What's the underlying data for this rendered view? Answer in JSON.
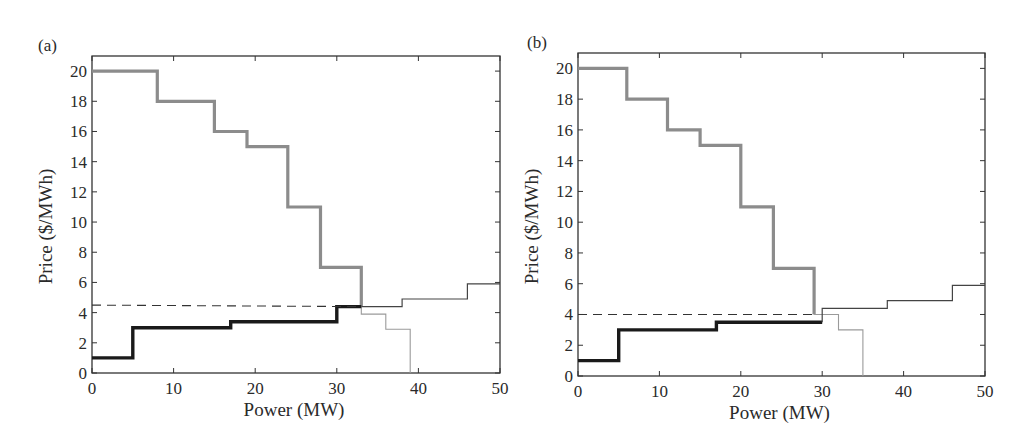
{
  "chart_data": [
    {
      "type": "line",
      "panel_label": "(a)",
      "xlabel": "Power (MW)",
      "ylabel": "Price ($/MWh)",
      "xlim": [
        0,
        50
      ],
      "ylim": [
        0,
        21
      ],
      "xticks": [
        0,
        10,
        20,
        30,
        40,
        50
      ],
      "yticks": [
        0,
        2,
        4,
        6,
        8,
        10,
        12,
        14,
        16,
        18,
        20
      ],
      "grid": false,
      "series": [
        {
          "name": "demand-bid-accepted",
          "style": "thick-gray",
          "color": "#8c8c8c",
          "step_points": [
            [
              0,
              20
            ],
            [
              8,
              20
            ],
            [
              8,
              18
            ],
            [
              15,
              18
            ],
            [
              15,
              16
            ],
            [
              19,
              16
            ],
            [
              19,
              15
            ],
            [
              24,
              15
            ],
            [
              24,
              11
            ],
            [
              28,
              11
            ],
            [
              28,
              7
            ],
            [
              33,
              7
            ],
            [
              33,
              4.4
            ]
          ]
        },
        {
          "name": "demand-bid-rejected",
          "style": "thin-gray",
          "color": "#9a9a9a",
          "step_points": [
            [
              33,
              4.4
            ],
            [
              33,
              3.9
            ],
            [
              36,
              3.9
            ],
            [
              36,
              2.9
            ],
            [
              39,
              2.9
            ],
            [
              39,
              0
            ]
          ]
        },
        {
          "name": "supply-offer-accepted",
          "style": "thick-black",
          "color": "#1a1a1a",
          "step_points": [
            [
              0,
              1
            ],
            [
              5,
              1
            ],
            [
              5,
              3
            ],
            [
              17,
              3
            ],
            [
              17,
              3.4
            ],
            [
              30,
              3.4
            ],
            [
              30,
              4.4
            ],
            [
              33,
              4.4
            ]
          ]
        },
        {
          "name": "supply-offer-rejected",
          "style": "thin-dark",
          "color": "#444444",
          "step_points": [
            [
              33,
              4.4
            ],
            [
              38,
              4.4
            ],
            [
              38,
              4.9
            ],
            [
              46,
              4.9
            ],
            [
              46,
              5.9
            ],
            [
              50,
              5.9
            ]
          ]
        },
        {
          "name": "clearing-price",
          "style": "dashed",
          "color": "#333333",
          "step_points": [
            [
              0,
              4.5
            ],
            [
              33,
              4.4
            ]
          ]
        }
      ]
    },
    {
      "type": "line",
      "panel_label": "(b)",
      "xlabel": "Power (MW)",
      "ylabel": "Price ($/MWh)",
      "xlim": [
        0,
        50
      ],
      "ylim": [
        0,
        21
      ],
      "xticks": [
        0,
        10,
        20,
        30,
        40,
        50
      ],
      "yticks": [
        0,
        2,
        4,
        6,
        8,
        10,
        12,
        14,
        16,
        18,
        20
      ],
      "grid": false,
      "series": [
        {
          "name": "demand-bid-accepted",
          "style": "thick-gray",
          "color": "#8c8c8c",
          "step_points": [
            [
              0,
              20
            ],
            [
              6,
              20
            ],
            [
              6,
              18
            ],
            [
              11,
              18
            ],
            [
              11,
              16
            ],
            [
              15,
              16
            ],
            [
              15,
              15
            ],
            [
              20,
              15
            ],
            [
              20,
              11
            ],
            [
              24,
              11
            ],
            [
              24,
              7
            ],
            [
              29,
              7
            ],
            [
              29,
              4
            ]
          ]
        },
        {
          "name": "demand-bid-rejected",
          "style": "thin-gray",
          "color": "#9a9a9a",
          "step_points": [
            [
              29,
              4
            ],
            [
              32,
              4
            ],
            [
              32,
              3
            ],
            [
              35,
              3
            ],
            [
              35,
              0
            ]
          ]
        },
        {
          "name": "supply-offer-accepted",
          "style": "thick-black",
          "color": "#1a1a1a",
          "step_points": [
            [
              0,
              1
            ],
            [
              5,
              1
            ],
            [
              5,
              3
            ],
            [
              17,
              3
            ],
            [
              17,
              3.5
            ],
            [
              30,
              3.5
            ]
          ]
        },
        {
          "name": "supply-offer-rejected",
          "style": "thin-dark",
          "color": "#444444",
          "step_points": [
            [
              30,
              3.5
            ],
            [
              30,
              4.4
            ],
            [
              38,
              4.4
            ],
            [
              38,
              4.9
            ],
            [
              46,
              4.9
            ],
            [
              46,
              5.9
            ],
            [
              50,
              5.9
            ]
          ]
        },
        {
          "name": "clearing-price",
          "style": "dashed",
          "color": "#333333",
          "step_points": [
            [
              0,
              4
            ],
            [
              29,
              4
            ]
          ]
        }
      ]
    }
  ]
}
